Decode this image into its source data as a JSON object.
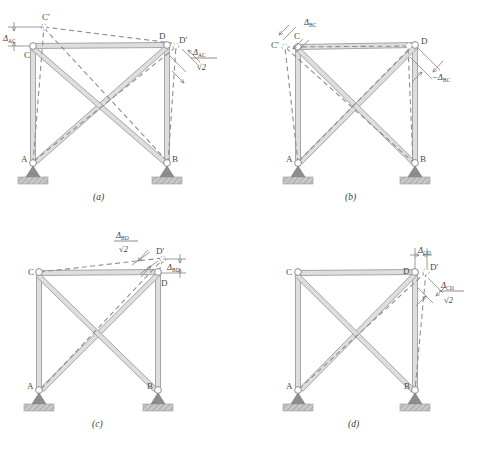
{
  "figure": {
    "background": "#ffffff",
    "member_color": "#9a9a9a",
    "member_fill": "#d8d8d8",
    "dashed_color": "#8c8c8c",
    "support_color": "#8f8f8f",
    "hatch_color": "#b3b3b3",
    "text_color": "#3f3f3f"
  },
  "panels": [
    {
      "id": "a",
      "caption": "(a)",
      "joints": [
        {
          "name": "A",
          "label": "A"
        },
        {
          "name": "B",
          "label": "B"
        },
        {
          "name": "C",
          "label": "C"
        },
        {
          "name": "D",
          "label": "D"
        },
        {
          "name": "C-prime",
          "label": "C'"
        },
        {
          "name": "D-prime",
          "label": "D'"
        }
      ],
      "dimensions": [
        {
          "name": "delta-ac",
          "symbol": "Δ",
          "subscript": "AC",
          "denominator": "",
          "position": "top-left"
        },
        {
          "name": "delta-ac-over-root2",
          "symbol": "Δ",
          "subscript": "AC",
          "denominator": "√2",
          "position": "right"
        }
      ]
    },
    {
      "id": "b",
      "caption": "(b)",
      "joints": [
        {
          "name": "A",
          "label": "A"
        },
        {
          "name": "B",
          "label": "B"
        },
        {
          "name": "C",
          "label": "C"
        },
        {
          "name": "D",
          "label": "D"
        },
        {
          "name": "C-prime",
          "label": "C'"
        }
      ],
      "dimensions": [
        {
          "name": "delta-bc",
          "symbol": "Δ",
          "subscript": "BC",
          "denominator": "",
          "position": "top-left"
        },
        {
          "name": "neg-delta-bc",
          "symbol": "−Δ",
          "subscript": "BC",
          "denominator": "",
          "position": "right"
        }
      ]
    },
    {
      "id": "c",
      "caption": "(c)",
      "joints": [
        {
          "name": "A",
          "label": "A"
        },
        {
          "name": "B",
          "label": "B"
        },
        {
          "name": "C",
          "label": "C"
        },
        {
          "name": "D",
          "label": "D"
        },
        {
          "name": "D-prime",
          "label": "D'"
        }
      ],
      "dimensions": [
        {
          "name": "delta-bd-over-root2",
          "symbol": "Δ",
          "subscript": "BD",
          "denominator": "√2",
          "position": "top"
        },
        {
          "name": "delta-bd",
          "symbol": "Δ",
          "subscript": "BD",
          "denominator": "",
          "position": "right"
        }
      ]
    },
    {
      "id": "d",
      "caption": "(d)",
      "joints": [
        {
          "name": "A",
          "label": "A"
        },
        {
          "name": "B",
          "label": "B"
        },
        {
          "name": "C",
          "label": "C"
        },
        {
          "name": "D",
          "label": "D"
        },
        {
          "name": "D-prime",
          "label": "D'"
        }
      ],
      "dimensions": [
        {
          "name": "delta-cd",
          "symbol": "Δ",
          "subscript": "CD",
          "denominator": "",
          "position": "top"
        },
        {
          "name": "delta-cd-over-root2",
          "symbol": "Δ",
          "subscript": "CD",
          "denominator": "√2",
          "position": "right"
        }
      ]
    }
  ],
  "labels": {
    "A": "A",
    "B": "B",
    "C": "C",
    "D": "D",
    "Cp": "C'",
    "Dp": "D'",
    "delta": "Δ",
    "negdelta": "−Δ",
    "root2": "√2",
    "sub_AC": "AC",
    "sub_BC": "BC",
    "sub_BD": "BD",
    "sub_CD": "CD",
    "cap_a": "(a)",
    "cap_b": "(b)",
    "cap_c": "(c)",
    "cap_d": "(d)"
  }
}
